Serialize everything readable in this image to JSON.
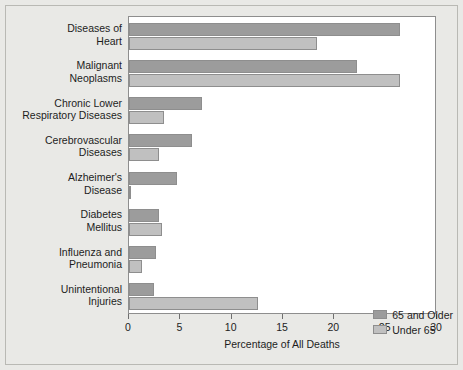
{
  "chart_data": {
    "type": "bar",
    "orientation": "horizontal",
    "title": "",
    "xlabel": "Percentage of All Deaths",
    "ylabel": "",
    "xlim": [
      0,
      30
    ],
    "xticks": [
      0,
      5,
      10,
      15,
      20,
      25,
      30
    ],
    "xtick_labels": [
      "0",
      "5",
      "10",
      "15",
      "20",
      "25",
      "30"
    ],
    "grid": false,
    "legend_position": "bottom-right",
    "categories": [
      "Diseases of\nHeart",
      "Malignant\nNeoplasms",
      "Chronic Lower\nRespiratory Diseases",
      "Cerebrovascular\nDiseases",
      "Alzheimer's\nDisease",
      "Diabetes\nMellitus",
      "Influenza and\nPneumonia",
      "Unintentional\nInjuries"
    ],
    "series": [
      {
        "name": "65 and Older",
        "color": "#9c9c9c",
        "values": [
          26.4,
          22.2,
          7.1,
          6.1,
          4.7,
          2.9,
          2.6,
          2.4
        ]
      },
      {
        "name": "Under 65",
        "color": "#bfbfbf",
        "values": [
          18.3,
          26.4,
          3.4,
          2.9,
          0.1,
          3.2,
          1.3,
          12.6
        ]
      }
    ]
  },
  "legend": {
    "entries": [
      {
        "label": "65 and Older"
      },
      {
        "label": "Under 65"
      }
    ]
  },
  "axis": {
    "x_title": "Percentage of All Deaths"
  }
}
